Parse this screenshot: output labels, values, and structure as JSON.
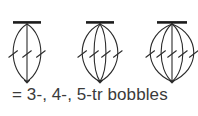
{
  "page": {
    "background_color": "#ffffff",
    "width": 198,
    "height": 116,
    "kind": "crochet-stitch-symbol-diagram"
  },
  "caption": {
    "text": "= 3-, 4-, 5-tr bobbles",
    "color": "#3a3a3a",
    "font_size_px": 17
  },
  "style": {
    "stroke_color": "#2b2b2b",
    "stroke_color_light": "#4a4a4a",
    "cap_bar_color": "#1c1c1c",
    "stroke_width": 1.1,
    "cap_bar_thickness": 2.6
  },
  "symbols": [
    {
      "name": "3-tr-bobble",
      "label": "3-tr bobble",
      "strand_count": 3,
      "slash_count": 3,
      "center_x": 27,
      "top_y": 23,
      "bottom_y": 82,
      "half_width": 14,
      "cap_half_width": 14,
      "slash_y": 54
    },
    {
      "name": "4-tr-bobble",
      "label": "4-tr bobble",
      "strand_count": 4,
      "slash_count": 4,
      "center_x": 100,
      "top_y": 23,
      "bottom_y": 82,
      "half_width": 18,
      "cap_half_width": 14,
      "slash_y": 54
    },
    {
      "name": "5-tr-bobble",
      "label": "5-tr bobble",
      "strand_count": 5,
      "slash_count": 5,
      "center_x": 172,
      "top_y": 23,
      "bottom_y": 82,
      "half_width": 22,
      "cap_half_width": 15,
      "slash_y": 54
    }
  ]
}
